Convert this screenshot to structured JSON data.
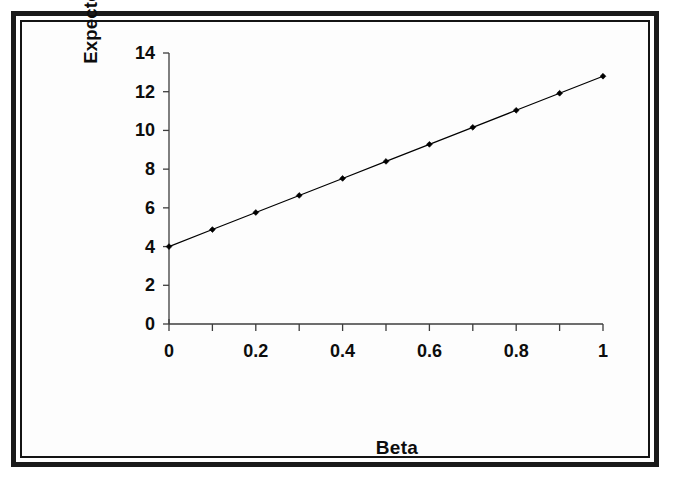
{
  "figure": {
    "background_color": "#ffffff",
    "frame_color": "#1a1a1a",
    "plot_background_color": "#fdfdfd"
  },
  "chart_data": {
    "type": "line",
    "title": "",
    "subtitle": "",
    "xlabel": "Beta",
    "ylabel": "Expected Return (%) .",
    "xlim": [
      0,
      1
    ],
    "ylim": [
      0,
      14
    ],
    "x_tick_labels": [
      "0",
      "0.2",
      "0.4",
      "0.6",
      "0.8",
      "1"
    ],
    "x_tick_values": [
      0,
      0.2,
      0.4,
      0.6,
      0.8,
      1
    ],
    "x_minor_tick_values": [
      0,
      0.1,
      0.2,
      0.3,
      0.4,
      0.5,
      0.6,
      0.7,
      0.8,
      0.9,
      1
    ],
    "y_tick_labels": [
      "0",
      "2",
      "4",
      "6",
      "8",
      "10",
      "12",
      "14"
    ],
    "y_tick_values": [
      0,
      2,
      4,
      6,
      8,
      10,
      12,
      14
    ],
    "grid": false,
    "legend": null,
    "legend_position": "none",
    "annotations": [],
    "series": [
      {
        "name": "Security Market Line",
        "color": "#000000",
        "marker": "diamond",
        "marker_color": "#000000",
        "line_width": 1.2,
        "x": [
          0,
          0.1,
          0.2,
          0.3,
          0.4,
          0.5,
          0.6,
          0.7,
          0.8,
          0.9,
          1
        ],
        "values": [
          4.0,
          4.88,
          5.76,
          6.64,
          7.52,
          8.4,
          9.28,
          10.16,
          11.04,
          11.92,
          12.8
        ]
      }
    ],
    "intercept": 4.0,
    "slope": 8.8
  }
}
